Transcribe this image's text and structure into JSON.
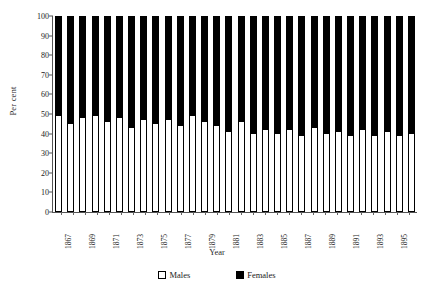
{
  "chart_data": {
    "type": "bar",
    "subtype": "stacked-100-percent",
    "title": "",
    "xlabel": "Year",
    "ylabel": "Per cent",
    "ylim": [
      0,
      100
    ],
    "ytick_step": 10,
    "yticks": [
      0,
      10,
      20,
      30,
      40,
      50,
      60,
      70,
      80,
      90,
      100
    ],
    "grid": false,
    "legend_position": "bottom-center",
    "categories": [
      "1867",
      "1868",
      "1869",
      "1870",
      "1871",
      "1872",
      "1873",
      "1874",
      "1875",
      "1876",
      "1877",
      "1878",
      "1879",
      "1880",
      "1881",
      "1882",
      "1883",
      "1884",
      "1885",
      "1886",
      "1887",
      "1888",
      "1889",
      "1890",
      "1891",
      "1892",
      "1893",
      "1894",
      "1895",
      "1896"
    ],
    "xtick_labels_shown": [
      "1867",
      "",
      "1869",
      "",
      "1871",
      "",
      "1873",
      "",
      "1875",
      "",
      "1877",
      "",
      "1879",
      "",
      "1881",
      "",
      "1883",
      "",
      "1885",
      "",
      "1887",
      "",
      "1889",
      "",
      "1891",
      "",
      "1893",
      "",
      "1895",
      ""
    ],
    "series": [
      {
        "name": "Males",
        "color": "#ffffff",
        "values": [
          49,
          45,
          48,
          49,
          46,
          48,
          43,
          47,
          45,
          47,
          44,
          49,
          46,
          44,
          41,
          46,
          40,
          42,
          40,
          42,
          39,
          43,
          40,
          41,
          39,
          42,
          39,
          41,
          39,
          40
        ]
      },
      {
        "name": "Females",
        "color": "#000000",
        "values": [
          51,
          55,
          52,
          51,
          54,
          52,
          57,
          53,
          55,
          53,
          56,
          51,
          54,
          56,
          59,
          54,
          60,
          58,
          60,
          58,
          61,
          57,
          60,
          59,
          61,
          58,
          61,
          59,
          61,
          60
        ]
      }
    ]
  },
  "legend": {
    "items": [
      {
        "label": "Males",
        "swatch": "white-square"
      },
      {
        "label": "Females",
        "swatch": "black-square"
      }
    ]
  }
}
